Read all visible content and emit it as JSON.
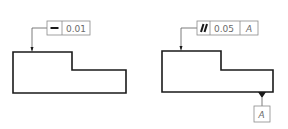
{
  "figures": [
    {
      "name": "straightness-example",
      "control_frame": {
        "symbol": "straightness-icon",
        "tolerance": "0.01"
      }
    },
    {
      "name": "parallelism-example",
      "control_frame": {
        "symbol": "parallelism-icon",
        "tolerance": "0.05",
        "datum_ref": "A"
      },
      "datum_feature": {
        "label": "A"
      }
    }
  ],
  "colors": {
    "outline": "#1a1a1a",
    "frame": "#8a8a8a",
    "text": "#6a6a6a"
  }
}
